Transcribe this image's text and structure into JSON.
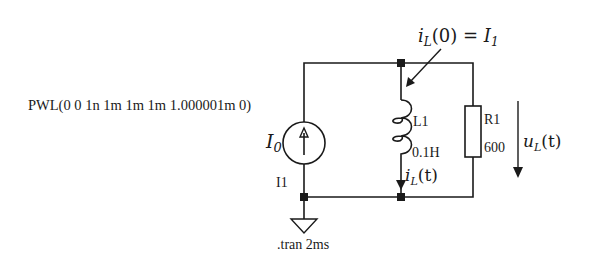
{
  "diagram": {
    "type": "circuit-schematic",
    "source": {
      "name": "I1",
      "symbol_label": "I",
      "symbol_sub": "0",
      "waveform": "PWL(0 0 1n 1m 1m 1m 1.000001m 0)"
    },
    "inductor": {
      "name": "L1",
      "value": "0.1H",
      "current_label": "i",
      "current_sub": "L",
      "current_arg": "(t)"
    },
    "resistor": {
      "name": "R1",
      "value": "600",
      "voltage_label": "u",
      "voltage_sub": "L",
      "voltage_arg": "(t)"
    },
    "initial_condition": {
      "lhs": "i",
      "lhs_sub": "L",
      "lhs_arg": "(0) = ",
      "rhs": "I",
      "rhs_sub": "1"
    },
    "directive": ".tran 2ms",
    "colors": {
      "ink": "#1a1a1a",
      "background": "#ffffff"
    }
  }
}
